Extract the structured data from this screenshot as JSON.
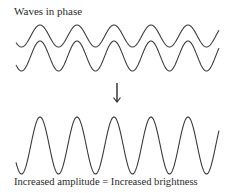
{
  "diagram": {
    "title": "Waves in phase",
    "caption": "Increased amplitude = Increased brightness",
    "arrow": "down-arrow",
    "waves": [
      {
        "name": "input-wave-1",
        "cycles": 5.5,
        "amplitude": "small"
      },
      {
        "name": "input-wave-2",
        "cycles": 5.5,
        "amplitude": "small"
      },
      {
        "name": "resultant-wave",
        "cycles": 5.5,
        "amplitude": "large"
      }
    ],
    "stroke_color": "#3a3a3a"
  }
}
